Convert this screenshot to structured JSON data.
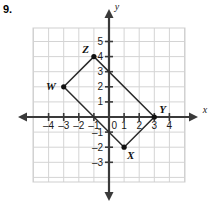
{
  "problem": {
    "number": "9."
  },
  "chart_data": {
    "type": "scatter",
    "title": "",
    "xlabel": "x",
    "ylabel": "y",
    "grid": true,
    "legend": false,
    "xlim": [
      -5,
      5
    ],
    "ylim": [
      -4,
      6
    ],
    "x_ticks": [
      -4,
      -3,
      -2,
      -1,
      0,
      1,
      2,
      3,
      4
    ],
    "x_tick_labels": [
      "–4",
      "–3",
      "–2",
      "–1",
      "0",
      "1",
      "2",
      "3",
      "4"
    ],
    "y_ticks": [
      -3,
      -2,
      -1,
      1,
      2,
      3,
      4,
      5
    ],
    "y_tick_labels": [
      "–3",
      "–2",
      "–1",
      "1",
      "2",
      "3",
      "4",
      "5"
    ],
    "origin_label": "0",
    "points": [
      {
        "name": "W",
        "x": -3,
        "y": 2,
        "label": "W",
        "label_pos": "left"
      },
      {
        "name": "Z",
        "x": -1,
        "y": 4,
        "label": "Z",
        "label_pos": "upper-left"
      },
      {
        "name": "Y",
        "x": 3,
        "y": 0,
        "label": "Y",
        "label_pos": "upper-right"
      },
      {
        "name": "X",
        "x": 1,
        "y": -2,
        "label": "X",
        "label_pos": "lower-right"
      }
    ],
    "polygon": [
      "W",
      "Z",
      "Y",
      "X"
    ],
    "colors": {
      "grid": "#d4d4d4",
      "axis": "#3a3a3a",
      "shape": "#2b2b2b",
      "vertex": "#111111",
      "background": "#ffffff"
    }
  }
}
